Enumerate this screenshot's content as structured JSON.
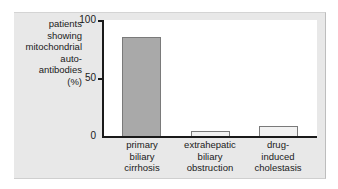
{
  "chart_data": {
    "type": "bar",
    "title": "",
    "xlabel": "",
    "ylabel": "patients showing mitochondrial auto-antibodies (%)",
    "ylabel_lines": [
      "patients",
      "showing",
      "mitochondrial",
      "auto-",
      "antibodies",
      "(%)"
    ],
    "ylim": [
      0,
      100
    ],
    "yticks": [
      "0",
      "50",
      "100"
    ],
    "grid": false,
    "legend": null,
    "categories": [
      "primary biliary cirrhosis",
      "extrahepatic biliary obstruction",
      "drug-induced cholestasis"
    ],
    "category_lines": [
      [
        "primary",
        "biliary",
        "cirrhosis"
      ],
      [
        "extrahepatic",
        "biliary",
        "obstruction"
      ],
      [
        "drug-",
        "induced",
        "cholestasis"
      ]
    ],
    "values": [
      85,
      4,
      9
    ],
    "bar_colors": [
      "#a9a9a9",
      "#f2f2f2",
      "#f2f2f2"
    ]
  }
}
